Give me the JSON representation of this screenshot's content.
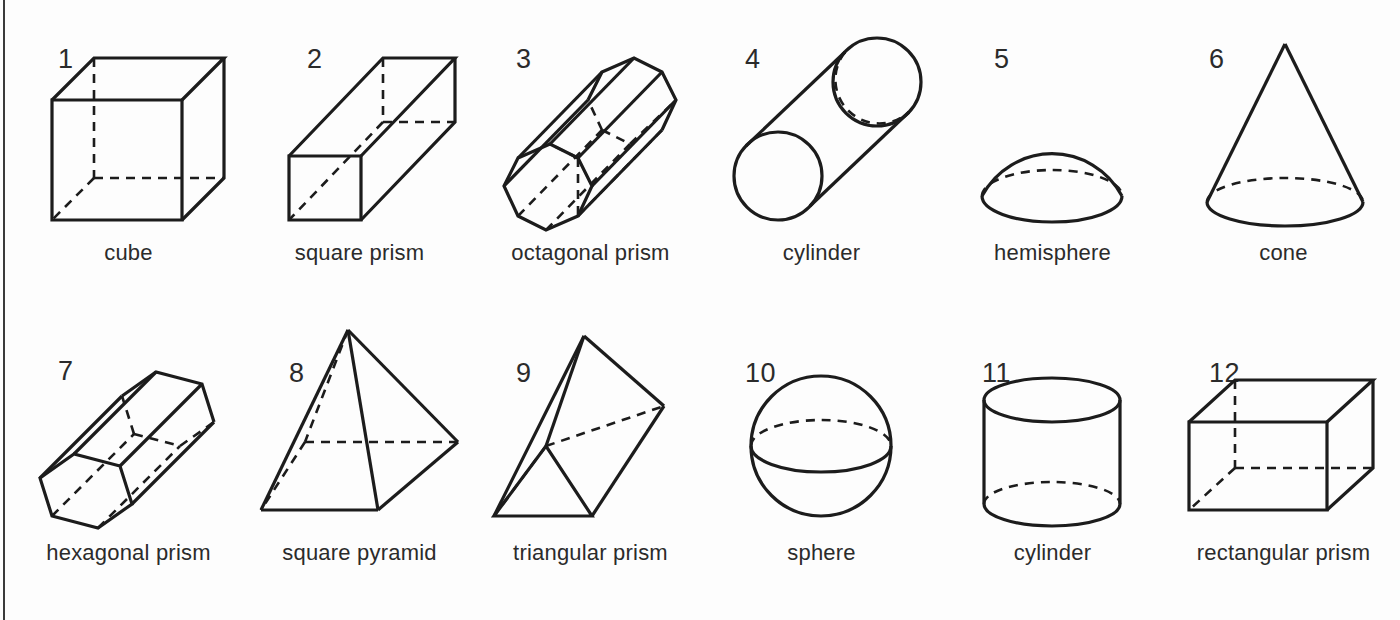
{
  "page": {
    "background_color": "#fdfdfd",
    "ink_color": "#1c1c1c",
    "border": {
      "side": "left",
      "color": "#3a3a3a"
    }
  },
  "grid": {
    "columns": 6,
    "rows": 2,
    "total_figures": 12
  },
  "figures": [
    {
      "number": "1",
      "label": "cube",
      "icon": "cube-icon"
    },
    {
      "number": "2",
      "label": "square prism",
      "icon": "square-prism-icon"
    },
    {
      "number": "3",
      "label": "octagonal prism",
      "icon": "octagonal-prism-icon"
    },
    {
      "number": "4",
      "label": "cylinder",
      "icon": "cylinder-diagonal-icon"
    },
    {
      "number": "5",
      "label": "hemisphere",
      "icon": "hemisphere-icon"
    },
    {
      "number": "6",
      "label": "cone",
      "icon": "cone-icon"
    },
    {
      "number": "7",
      "label": "hexagonal prism",
      "icon": "hexagonal-prism-icon"
    },
    {
      "number": "8",
      "label": "square pyramid",
      "icon": "square-pyramid-icon"
    },
    {
      "number": "9",
      "label": "triangular prism",
      "icon": "triangular-prism-icon"
    },
    {
      "number": "10",
      "label": "sphere",
      "icon": "sphere-icon"
    },
    {
      "number": "11",
      "label": "cylinder",
      "icon": "cylinder-upright-icon"
    },
    {
      "number": "12",
      "label": "rectangular prism",
      "icon": "rectangular-prism-icon"
    }
  ]
}
